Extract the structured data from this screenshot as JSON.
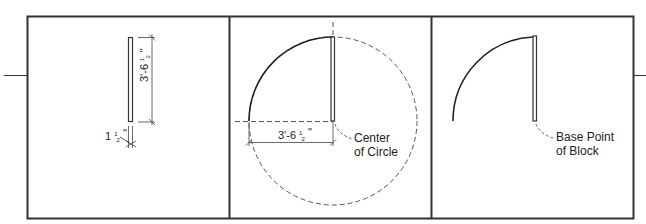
{
  "figure": {
    "panels": [
      {
        "id": "door-panel",
        "dimensions": {
          "length": {
            "whole": "3'-6",
            "frac_num": "1",
            "frac_den": "2",
            "unit": "\""
          },
          "thickness": {
            "whole": "1",
            "frac_num": "1",
            "frac_den": "2",
            "unit": "\""
          }
        }
      },
      {
        "id": "circle-construction",
        "dimension": {
          "whole": "3'-6",
          "frac_num": "1",
          "frac_den": "2",
          "unit": "\""
        },
        "callout": {
          "line1": "Center",
          "line2": "of Circle"
        }
      },
      {
        "id": "door-block",
        "callout": {
          "line1": "Base Point",
          "line2": "of Block"
        }
      }
    ],
    "colors": {
      "line": "#333333",
      "text": "#222222",
      "background": "#ffffff"
    }
  }
}
